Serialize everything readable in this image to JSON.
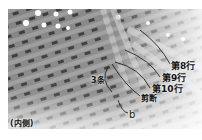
{
  "image": {
    "description": "Grayscale photo of woven basket strands seen from the inside, with annotation lines",
    "colors": {
      "background": "#ffffff",
      "strand_light": "#b8b8b8",
      "strand_dark": "#555555",
      "annotation": "#111111"
    }
  },
  "labels": {
    "row8": "第8行",
    "row9": "第9行",
    "row10": "第10行",
    "cut": "剪断",
    "three_strands": "3条",
    "b": "b",
    "inside": "(内侧)"
  }
}
